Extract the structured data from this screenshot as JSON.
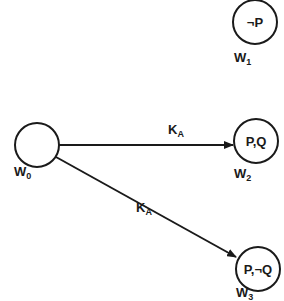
{
  "diagram": {
    "stroke_color": "#1a1a1a",
    "background": "#ffffff",
    "nodes": [
      {
        "id": "w0",
        "label_main": "W",
        "label_sub": "0",
        "content": ""
      },
      {
        "id": "w1",
        "label_main": "W",
        "label_sub": "1",
        "content": "¬P"
      },
      {
        "id": "w2",
        "label_main": "W",
        "label_sub": "2",
        "content": "P,Q"
      },
      {
        "id": "w3",
        "label_main": "W",
        "label_sub": "3",
        "content": "P,¬Q"
      }
    ],
    "edges": [
      {
        "from": "w0",
        "to": "w2",
        "label_main": "K",
        "label_sub": "A"
      },
      {
        "from": "w0",
        "to": "w3",
        "label_main": "K",
        "label_sub": "A"
      }
    ]
  }
}
